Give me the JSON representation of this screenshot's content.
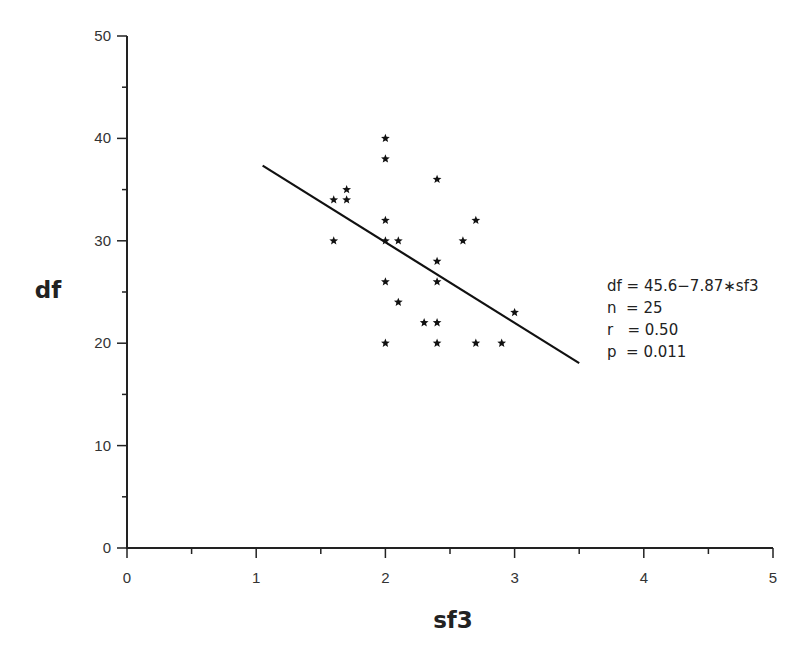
{
  "chart_data": {
    "type": "scatter",
    "title": "",
    "xlabel": "sf3",
    "ylabel": "df",
    "xlim": [
      0,
      5
    ],
    "ylim": [
      0,
      50
    ],
    "x_ticks": [
      0,
      1,
      2,
      3,
      4,
      5
    ],
    "y_ticks": [
      0,
      10,
      20,
      30,
      40,
      50
    ],
    "grid": false,
    "marker": "star",
    "points": [
      {
        "x": 2.0,
        "y": 40
      },
      {
        "x": 2.0,
        "y": 38
      },
      {
        "x": 2.4,
        "y": 36
      },
      {
        "x": 1.7,
        "y": 35
      },
      {
        "x": 1.6,
        "y": 34
      },
      {
        "x": 1.7,
        "y": 34
      },
      {
        "x": 2.0,
        "y": 32
      },
      {
        "x": 2.7,
        "y": 32
      },
      {
        "x": 1.6,
        "y": 30
      },
      {
        "x": 2.0,
        "y": 30
      },
      {
        "x": 2.1,
        "y": 30
      },
      {
        "x": 2.6,
        "y": 30
      },
      {
        "x": 2.4,
        "y": 28
      },
      {
        "x": 2.0,
        "y": 26
      },
      {
        "x": 2.4,
        "y": 26
      },
      {
        "x": 2.1,
        "y": 24
      },
      {
        "x": 3.0,
        "y": 23
      },
      {
        "x": 2.3,
        "y": 22
      },
      {
        "x": 2.4,
        "y": 22
      },
      {
        "x": 2.0,
        "y": 20
      },
      {
        "x": 2.4,
        "y": 20
      },
      {
        "x": 2.7,
        "y": 20
      },
      {
        "x": 2.9,
        "y": 20
      }
    ],
    "regression": {
      "intercept": 45.6,
      "slope": -7.87,
      "x_start": 1.05,
      "x_end": 3.5
    },
    "annotations": [
      "df = 45.6-7.87*sf3",
      "n  = 25",
      "r  = 0.50",
      "p  = 0.011"
    ]
  },
  "stats": {
    "equation": "df = 45.6−7.87∗sf3",
    "n": "n  = 25",
    "r": "r   = 0.50",
    "p": "p  = 0.011"
  },
  "axes": {
    "xlabel": "sf3",
    "ylabel": "df"
  }
}
